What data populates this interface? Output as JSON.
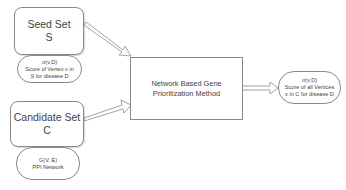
{
  "seed_set": {
    "title": "Seed Set",
    "symbol": "S",
    "annotation": {
      "formula": "σ(v,D)",
      "line1": "Score of Vertex v in",
      "line2": "S for disease D"
    }
  },
  "candidate_set": {
    "title": "Candidate Set",
    "symbol": "C",
    "annotation": {
      "formula": "G(V, E)",
      "line1": "PPI Network"
    }
  },
  "method": {
    "line1": "Network Based Gene",
    "line2": "Prioritization Method"
  },
  "output": {
    "formula": "σ(v,D)",
    "line1": "Score of all Vertices",
    "line2": "v in C for disease D"
  },
  "colors": {
    "stroke": "#8a8a8a",
    "text": "#444444",
    "background": "#ffffff"
  }
}
